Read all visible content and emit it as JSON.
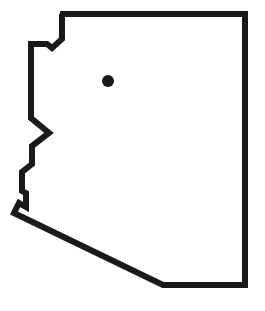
{
  "map": {
    "region": "Arizona state outline",
    "outline_color": "#1a1a1a",
    "fill_color": "#ffffff",
    "marker_color": "#1a1a1a",
    "stroke_width": 6,
    "outline_points": "60,14 245,14 245,285 163,285 14,213 19,203 26,207 26,193 22,191 22,172 32,164 32,146 49,133 31,118 31,44 47,44 52,48 62,39 62,14",
    "marker": {
      "cx": 108,
      "cy": 81,
      "r": 6
    }
  }
}
